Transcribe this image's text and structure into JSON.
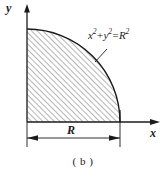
{
  "figure": {
    "caption": "( b )",
    "axes": {
      "x_label": "x",
      "y_label": "y"
    },
    "equation": {
      "lhs_var1": "x",
      "exp1": "2",
      "plus": "+",
      "lhs_var2": "y",
      "exp2": "2",
      "equals": "=",
      "rhs_var": "R",
      "exp3": "2",
      "full_text": "x2+y2=R2"
    },
    "dimension": {
      "radius_label": "R"
    },
    "colors": {
      "stroke": "#1a1a1a",
      "hatch": "#555555",
      "background": "#ffffff"
    },
    "geometry": {
      "origin_x": 27,
      "origin_y": 122,
      "radius": 93,
      "quadrant": "first",
      "shape": "quarter-circle",
      "hatch_angle_deg": 45
    }
  }
}
